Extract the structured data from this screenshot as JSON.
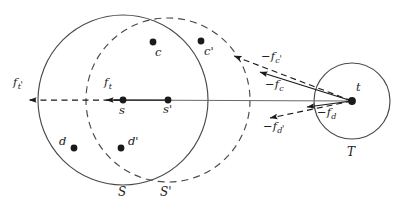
{
  "figure": {
    "type": "geometric-vector-diagram",
    "background_color": "#ffffff",
    "stroke_color": "#3a3a3a",
    "dot_color": "#1a1a1a",
    "width": 406,
    "height": 210
  },
  "shapes": {
    "circles": [
      {
        "name": "S",
        "label": "S",
        "cx": 123,
        "cy": 100,
        "r": 85,
        "style": "solid"
      },
      {
        "name": "Sp",
        "label": "S'",
        "cx": 168,
        "cy": 100,
        "r": 82,
        "style": "dashed"
      },
      {
        "name": "T",
        "label": "T",
        "cx": 352,
        "cy": 101,
        "r": 38,
        "style": "solid"
      }
    ]
  },
  "points": [
    {
      "name": "c",
      "label": "c",
      "x": 153,
      "y": 42,
      "label_x": 155,
      "label_y": 47
    },
    {
      "name": "cp",
      "label": "c'",
      "x": 201,
      "y": 41,
      "label_x": 204,
      "label_y": 46
    },
    {
      "name": "s",
      "label": "s",
      "x": 123,
      "y": 100,
      "label_x": 120,
      "label_y": 104
    },
    {
      "name": "sp",
      "label": "s'",
      "x": 168,
      "y": 100,
      "label_x": 164,
      "label_y": 104
    },
    {
      "name": "d",
      "label": "d",
      "x": 74,
      "y": 148,
      "label_x": 59,
      "label_y": 136
    },
    {
      "name": "dp",
      "label": "d'",
      "x": 121,
      "y": 148,
      "label_x": 128,
      "label_y": 136
    },
    {
      "name": "t",
      "label": "t",
      "x": 352,
      "y": 101,
      "label_x": 355,
      "label_y": 84
    }
  ],
  "vectors": [
    {
      "name": "f_t_prime",
      "label": "f",
      "sub": "t",
      "prime": "'",
      "style": "dashed",
      "from_x": 123,
      "from_y": 100,
      "to_x": 28,
      "to_y": 100,
      "label_x": 14,
      "label_y": 78
    },
    {
      "name": "f_t",
      "label": "f",
      "sub": "t",
      "prime": "",
      "style": "solid",
      "from_x": 168,
      "from_y": 100,
      "to_x": 105,
      "to_y": 100,
      "label_x": 104,
      "label_y": 78
    },
    {
      "name": "minus_f_c_prime",
      "label": "f",
      "sub": "c",
      "prime": "'",
      "style": "dashed",
      "from_x": 352,
      "from_y": 101,
      "to_x": 233,
      "to_y": 56,
      "label_x": 262,
      "label_y": 52
    },
    {
      "name": "minus_f_c",
      "label": "f",
      "sub": "c",
      "prime": "",
      "style": "solid",
      "from_x": 352,
      "from_y": 101,
      "to_x": 259,
      "to_y": 72,
      "label_x": 266,
      "label_y": 80
    },
    {
      "name": "minus_f_d",
      "label": "f",
      "sub": "d",
      "prime": "",
      "style": "solid",
      "from_x": 352,
      "from_y": 101,
      "to_x": 306,
      "to_y": 107,
      "label_x": 318,
      "label_y": 108
    },
    {
      "name": "minus_f_d_prime",
      "label": "f",
      "sub": "d",
      "prime": "'",
      "style": "dashed",
      "from_x": 352,
      "from_y": 101,
      "to_x": 269,
      "to_y": 118,
      "label_x": 266,
      "label_y": 122
    }
  ],
  "axis_line": {
    "name": "center-axis",
    "from_x": 28,
    "from_y": 100,
    "to_x": 352,
    "to_y": 101
  },
  "set_labels": [
    {
      "name": "S",
      "text": "S",
      "x": 118,
      "y": 186
    },
    {
      "name": "Sp",
      "text": "S'",
      "x": 160,
      "y": 186
    },
    {
      "name": "T",
      "text": "T",
      "x": 347,
      "y": 148
    }
  ]
}
